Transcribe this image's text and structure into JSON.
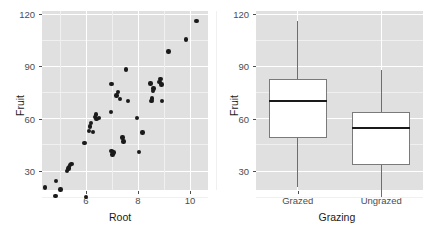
{
  "figure": {
    "title": "",
    "panels": [
      "scatter",
      "boxplot"
    ]
  },
  "chart_data": [
    {
      "type": "scatter",
      "title": "",
      "xlabel": "Root",
      "ylabel": "Fruit",
      "xlim": [
        4.2,
        10.6
      ],
      "ylim": [
        14,
        122
      ],
      "xticks": [
        6,
        8,
        10
      ],
      "yticks": [
        30,
        60,
        90,
        120
      ],
      "grid": true,
      "legend": "none",
      "point_color": "#1a1a1a",
      "panel_color": "#e0e0e0",
      "points": [
        {
          "x": 4.43,
          "y": 20.6
        },
        {
          "x": 4.83,
          "y": 15.8
        },
        {
          "x": 4.85,
          "y": 24.2
        },
        {
          "x": 5.02,
          "y": 19.5
        },
        {
          "x": 5.28,
          "y": 30.1
        },
        {
          "x": 5.32,
          "y": 31.4
        },
        {
          "x": 5.35,
          "y": 32.2
        },
        {
          "x": 5.39,
          "y": 33.4
        },
        {
          "x": 5.44,
          "y": 34.1
        },
        {
          "x": 6.01,
          "y": 15.1
        },
        {
          "x": 5.94,
          "y": 46.0
        },
        {
          "x": 6.11,
          "y": 52.9
        },
        {
          "x": 6.16,
          "y": 55.6
        },
        {
          "x": 6.19,
          "y": 57.5
        },
        {
          "x": 6.27,
          "y": 52.2
        },
        {
          "x": 6.35,
          "y": 60.9
        },
        {
          "x": 6.38,
          "y": 62.3
        },
        {
          "x": 6.41,
          "y": 59.8
        },
        {
          "x": 6.5,
          "y": 60.5
        },
        {
          "x": 6.98,
          "y": 41.6
        },
        {
          "x": 7.02,
          "y": 39.5
        },
        {
          "x": 7.06,
          "y": 40.5
        },
        {
          "x": 6.96,
          "y": 64.0
        },
        {
          "x": 6.98,
          "y": 80.0
        },
        {
          "x": 7.18,
          "y": 73.2
        },
        {
          "x": 7.22,
          "y": 75.4
        },
        {
          "x": 7.3,
          "y": 71.4
        },
        {
          "x": 7.4,
          "y": 49.1
        },
        {
          "x": 7.44,
          "y": 46.9
        },
        {
          "x": 7.53,
          "y": 88.2
        },
        {
          "x": 7.62,
          "y": 70.2
        },
        {
          "x": 7.96,
          "y": 60.4
        },
        {
          "x": 8.03,
          "y": 41.0
        },
        {
          "x": 8.18,
          "y": 52.0
        },
        {
          "x": 8.48,
          "y": 80.2
        },
        {
          "x": 8.52,
          "y": 70.0
        },
        {
          "x": 8.54,
          "y": 71.5
        },
        {
          "x": 8.57,
          "y": 75.7
        },
        {
          "x": 8.6,
          "y": 77.3
        },
        {
          "x": 8.82,
          "y": 81.0
        },
        {
          "x": 8.87,
          "y": 82.6
        },
        {
          "x": 8.9,
          "y": 79.5
        },
        {
          "x": 8.93,
          "y": 70.0
        },
        {
          "x": 9.17,
          "y": 98.5
        },
        {
          "x": 9.84,
          "y": 105.4
        },
        {
          "x": 10.25,
          "y": 116.0
        }
      ]
    },
    {
      "type": "boxplot",
      "title": "",
      "xlabel": "Grazing",
      "ylabel": "Fruit",
      "ylim": [
        14,
        122
      ],
      "yticks": [
        30,
        60,
        90,
        120
      ],
      "categories": [
        "Grazed",
        "Ungrazed"
      ],
      "grid": true,
      "legend": "none",
      "box_fill": "#ffffff",
      "box_border": "#7a7a7a",
      "panel_color": "#e0e0e0",
      "boxes": [
        {
          "label": "Grazed",
          "min": 20.8,
          "q1": 49.2,
          "median": 70.2,
          "q3": 82.8,
          "max": 116.0
        },
        {
          "label": "Ungrazed",
          "min": 15.2,
          "q1": 33.5,
          "median": 54.5,
          "q3": 64.0,
          "max": 87.7
        }
      ]
    }
  ],
  "left": {
    "ylabel": "Fruit",
    "xlabel": "Root",
    "ytick_labels": [
      "120",
      "90",
      "60",
      "30"
    ],
    "xtick_labels": [
      "6",
      "8",
      "10"
    ]
  },
  "right": {
    "ylabel": "Fruit",
    "xlabel": "Grazing",
    "ytick_labels": [
      "120",
      "90",
      "60",
      "30"
    ],
    "xtick_labels": [
      "Grazed",
      "Ungrazed"
    ]
  }
}
